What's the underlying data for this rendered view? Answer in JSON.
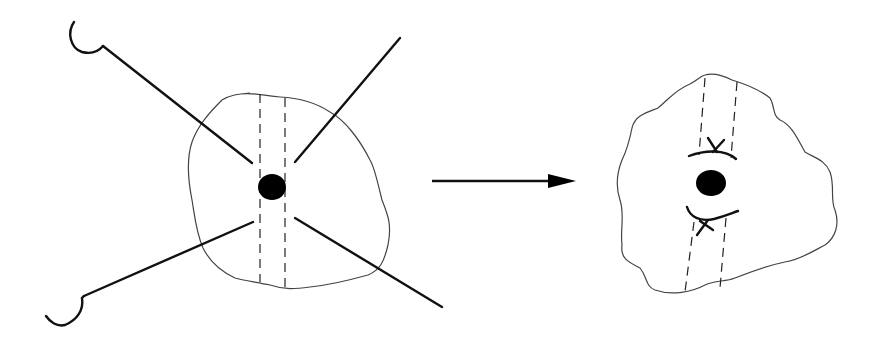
{
  "diagram": {
    "colors": {
      "line": "#111111",
      "outline": "#444444",
      "background": "#ffffff"
    },
    "panels": [
      {
        "id": "before",
        "elements": [
          "tissue-outline",
          "dashed-channel",
          "center-dot",
          "suture-lines-4",
          "hooked-needles-2"
        ]
      },
      {
        "id": "after",
        "elements": [
          "tissue-outline",
          "dashed-channel",
          "center-dot",
          "tied-suture-arcs-2"
        ]
      }
    ],
    "arrow": {
      "direction": "right"
    }
  }
}
